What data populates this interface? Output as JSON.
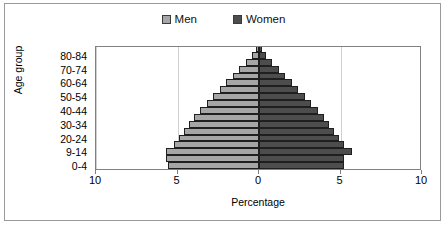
{
  "legend": {
    "position": "top-center",
    "entries": [
      {
        "label": "Men",
        "color": "#a6a6a6"
      },
      {
        "label": "Women",
        "color": "#4d4d4d"
      }
    ]
  },
  "axes": {
    "y_title": "Age group",
    "x_title": "Percentage"
  },
  "chart_data": {
    "type": "bar",
    "subtype": "population-pyramid",
    "title": "",
    "xlabel": "Percentage",
    "ylabel": "Age group",
    "xlim": [
      -10,
      10
    ],
    "x_tick_labels": [
      "10",
      "5",
      "0",
      "5",
      "10"
    ],
    "x_tick_values": [
      -10,
      -5,
      0,
      5,
      10
    ],
    "grid": true,
    "grid_axis": "x",
    "legend_position": "top-center",
    "orientation": "horizontal",
    "categories": [
      "0-4",
      "5-9",
      "9-14",
      "15-19",
      "20-24",
      "25-29",
      "30-34",
      "35-39",
      "40-44",
      "45-49",
      "50-54",
      "55-59",
      "60-64",
      "65-69",
      "70-74",
      "75-79",
      "80-84",
      "85+"
    ],
    "visible_category_labels": [
      "80-84",
      "70-74",
      "60-64",
      "50-54",
      "40-44",
      "30-34",
      "20-24",
      "9-14",
      "0-4"
    ],
    "series": [
      {
        "name": "Men",
        "color": "#a6a6a6",
        "side": "left",
        "values": [
          5.6,
          5.7,
          5.7,
          5.2,
          4.9,
          4.6,
          4.3,
          4.0,
          3.6,
          3.2,
          2.8,
          2.4,
          2.0,
          1.6,
          1.2,
          0.8,
          0.45,
          0.2
        ]
      },
      {
        "name": "Women",
        "color": "#4d4d4d",
        "side": "right",
        "values": [
          5.2,
          5.2,
          5.7,
          5.2,
          4.9,
          4.6,
          4.3,
          4.0,
          3.6,
          3.2,
          2.8,
          2.4,
          2.0,
          1.6,
          1.2,
          0.8,
          0.45,
          0.2
        ]
      }
    ]
  }
}
